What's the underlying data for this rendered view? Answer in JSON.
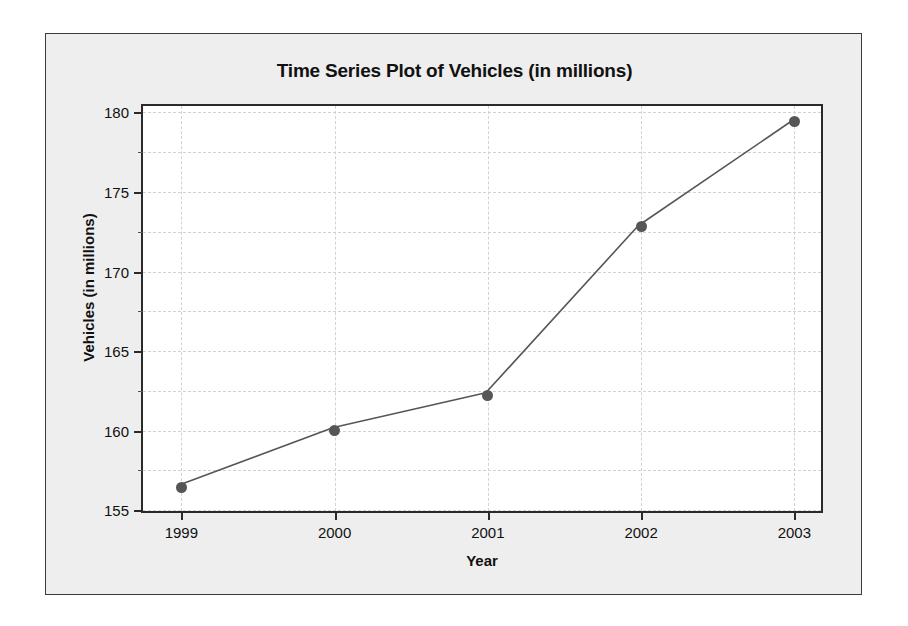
{
  "chart_data": {
    "type": "line",
    "title": "Time Series Plot of Vehicles (in millions)",
    "xlabel": "Year",
    "ylabel": "Vehicles (in millions)",
    "categories": [
      "1999",
      "2000",
      "2001",
      "2002",
      "2003"
    ],
    "x": [
      1999,
      2000,
      2001,
      2002,
      2003
    ],
    "values": [
      156.4,
      160.0,
      162.2,
      172.8,
      179.4
    ],
    "series": [
      {
        "name": "Vehicles (in millions)",
        "values": [
          156.4,
          160.0,
          162.2,
          172.8,
          179.4
        ]
      }
    ],
    "xlim": [
      1998.75,
      2003.2
    ],
    "ylim": [
      154.7,
      180.4
    ],
    "ytick_labels": [
      "155",
      "160",
      "165",
      "170",
      "175",
      "180"
    ],
    "yticks": [
      155,
      160,
      165,
      170,
      175,
      180
    ],
    "xtick_labels": [
      "1999",
      "2000",
      "2001",
      "2002",
      "2003"
    ],
    "xticks": [
      1999,
      2000,
      2001,
      2002,
      2003
    ],
    "minor_yticks": [
      157.5,
      162.5,
      167.5,
      172.5,
      177.5
    ],
    "grid": true,
    "grid_style": "dashed",
    "legend": false,
    "legend_position": "none",
    "marker": "circle",
    "colors": {
      "line": "#565656",
      "marker": "#565656",
      "grid": "#d2d2d2",
      "axis": "#2a2a2a",
      "figure_background": "#eeeeee",
      "plot_background": "#ffffff",
      "text": "#111111"
    }
  }
}
